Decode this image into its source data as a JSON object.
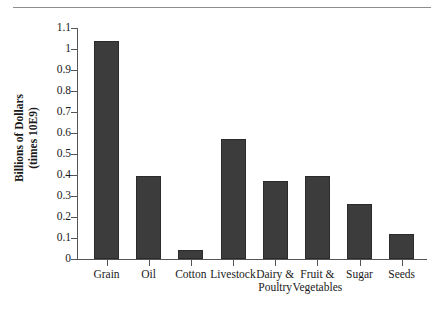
{
  "chart_data": {
    "type": "bar",
    "title": "",
    "xlabel": "",
    "ylabel": "Billions of Dollars\n(times 10E9)",
    "ylabel_line1": "Billions of Dollars",
    "ylabel_line2": "(times 10E9)",
    "categories": [
      "Grain",
      "Oil",
      "Cotton",
      "Livestock",
      "Dairy &\nPoultry",
      "Fruit &\nVegetables",
      "Sugar",
      "Seeds"
    ],
    "values": [
      1.04,
      0.395,
      0.045,
      0.57,
      0.37,
      0.395,
      0.26,
      0.12
    ],
    "ylim": [
      0,
      1.1
    ],
    "ytick_values": [
      1.1,
      1,
      0.9,
      0.8,
      0.7,
      0.6,
      0.5,
      0.4,
      0.3,
      0.2,
      0.1,
      0
    ],
    "ytick_labels": [
      "1.1",
      "1",
      "0.9",
      "0.8",
      "0.7",
      "0.6",
      "0.5",
      "0.4",
      "0.3",
      "0.2",
      "0.1",
      "0"
    ],
    "grid": false,
    "legend": null,
    "bar_color": "#3c3c3c",
    "axis_color": "#555555",
    "text_color": "#1a1a1a",
    "rule_color": "#8d8d8d"
  }
}
